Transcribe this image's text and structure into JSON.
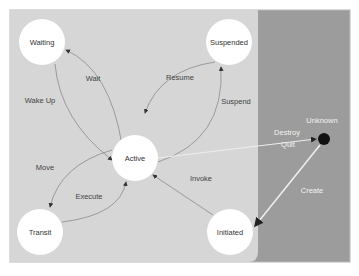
{
  "diagram": {
    "type": "state-machine",
    "colors": {
      "light_panel": "#d6d6d6",
      "dark_panel": "#9c9c9c",
      "node_fill": "#ffffff",
      "edge": "#8a8a8a",
      "external_edge": "#eeeeee",
      "terminal": "#111111"
    },
    "nodes": {
      "waiting": "Waiting",
      "suspended": "Suspended",
      "active": "Active",
      "transit": "Transit",
      "initiated": "Initiated",
      "unknown": "Unknown"
    },
    "edges": {
      "wait": "Wait",
      "wake_up": "Wake Up",
      "resume": "Resume",
      "suspend": "Suspend",
      "move": "Move",
      "execute": "Execute",
      "invoke": "Invoke",
      "destroy": "Destroy",
      "quit": "Quit",
      "create": "Create"
    }
  }
}
